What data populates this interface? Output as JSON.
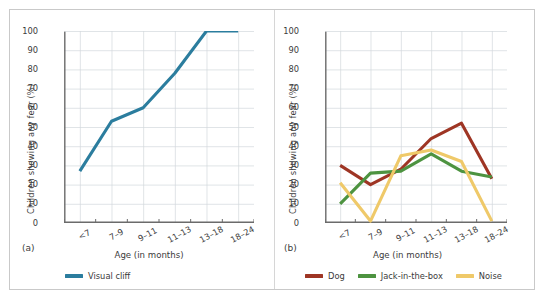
{
  "figure": {
    "panel_a_label": "(a)",
    "panel_b_label": "(b)",
    "background": "#ffffff",
    "frame_color": "#c9c9c9",
    "grid_color": "#d3d8dc",
    "axis_color": "#6b6b6b",
    "text_color": "#3b3b3b"
  },
  "chart_data": [
    {
      "type": "line",
      "panel": "(a)",
      "title": "",
      "xlabel": "Age (in months)",
      "ylabel": "Children showing any fear (%)",
      "categories": [
        "<7",
        "7–9",
        "9–11",
        "11–13",
        "13–18",
        "18–24"
      ],
      "ylim": [
        0,
        100
      ],
      "yticks": [
        0,
        10,
        20,
        30,
        40,
        50,
        60,
        70,
        80,
        90,
        100
      ],
      "grid": true,
      "legend_position": "bottom-left",
      "series": [
        {
          "name": "Visual cliff",
          "color": "#2b7d9e",
          "values": [
            27,
            53,
            60,
            78,
            100,
            100
          ]
        }
      ]
    },
    {
      "type": "line",
      "panel": "(b)",
      "title": "",
      "xlabel": "Age (in months)",
      "ylabel": "Children showing any fear (%)",
      "categories": [
        "<7",
        "7–9",
        "9–11",
        "11–13",
        "13–18",
        "18–24"
      ],
      "ylim": [
        0,
        100
      ],
      "yticks": [
        0,
        10,
        20,
        30,
        40,
        50,
        60,
        70,
        80,
        90,
        100
      ],
      "grid": true,
      "legend_position": "bottom-center",
      "series": [
        {
          "name": "Dog",
          "color": "#9e3524",
          "values": [
            30,
            20,
            28,
            44,
            52,
            23
          ]
        },
        {
          "name": "Jack-in-the-box",
          "color": "#4d9340",
          "values": [
            10,
            26,
            27,
            36,
            27,
            24
          ]
        },
        {
          "name": "Noise",
          "color": "#efc969",
          "values": [
            21,
            1,
            35,
            38,
            32,
            1
          ]
        }
      ]
    }
  ]
}
